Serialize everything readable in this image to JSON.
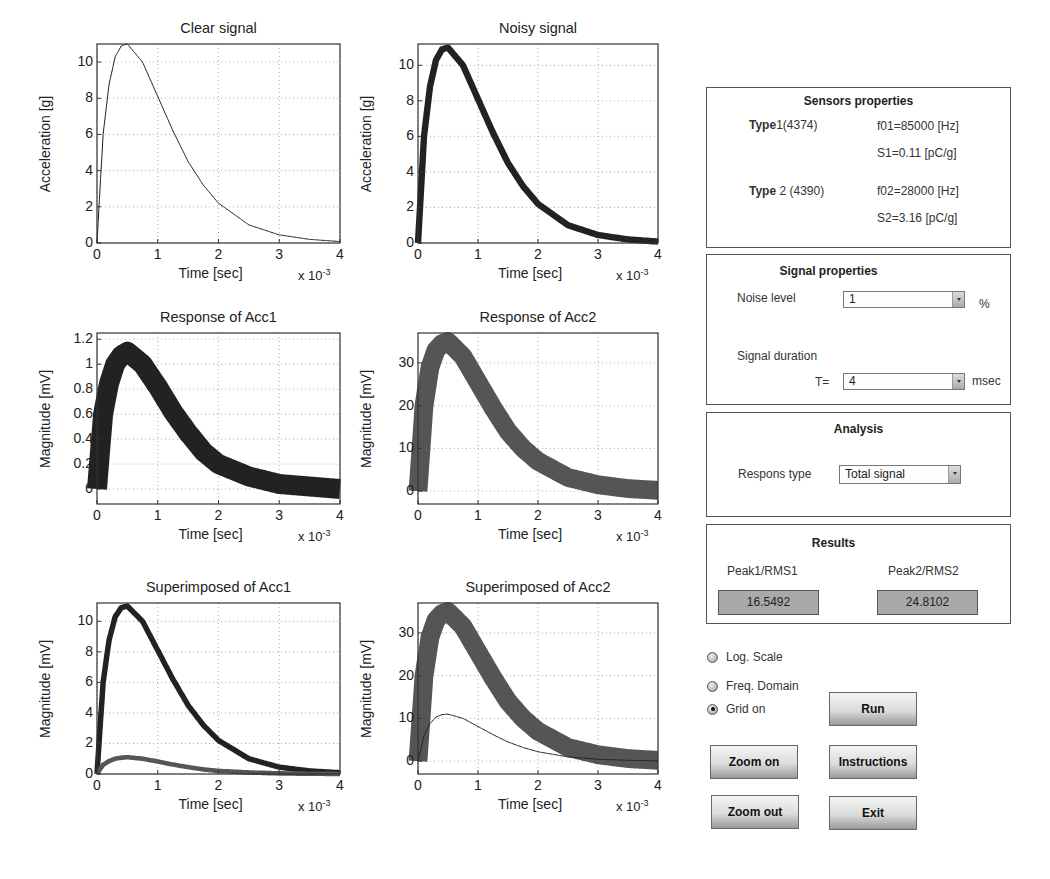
{
  "plots": [
    {
      "id": "clear",
      "title": "Clear signal",
      "ylabel": "Acceleration [g]",
      "xlabel": "Time [sec]",
      "xexp": "x 10",
      "xexp_pow": "-3",
      "yticks": [
        "0",
        "2",
        "4",
        "6",
        "8",
        "10"
      ],
      "xticks": [
        "0",
        "1",
        "2",
        "3",
        "4"
      ]
    },
    {
      "id": "noisy",
      "title": "Noisy signal",
      "ylabel": "Acceleration [g]",
      "xlabel": "Time [sec]",
      "xexp": "x 10",
      "xexp_pow": "-3",
      "yticks": [
        "0",
        "2",
        "4",
        "6",
        "8",
        "10"
      ],
      "xticks": [
        "0",
        "1",
        "2",
        "3",
        "4"
      ]
    },
    {
      "id": "resp1",
      "title": "Response of Acc1",
      "ylabel": "Magnitude [mV]",
      "xlabel": "Time [sec]",
      "xexp": "x 10",
      "xexp_pow": "-3",
      "yticks": [
        "0",
        "0.2",
        "0.4",
        "0.6",
        "0.8",
        "1",
        "1.2"
      ],
      "xticks": [
        "0",
        "1",
        "2",
        "3",
        "4"
      ]
    },
    {
      "id": "resp2",
      "title": "Response of Acc2",
      "ylabel": "Magnitude [mV]",
      "xlabel": "Time [sec]",
      "xexp": "x 10",
      "xexp_pow": "-3",
      "yticks": [
        "0",
        "10",
        "20",
        "30"
      ],
      "xticks": [
        "0",
        "1",
        "2",
        "3",
        "4"
      ]
    },
    {
      "id": "sup1",
      "title": "Superimposed of Acc1",
      "ylabel": "Magnitude [mV]",
      "xlabel": "Time [sec]",
      "xexp": "x 10",
      "xexp_pow": "-3",
      "yticks": [
        "0",
        "2",
        "4",
        "6",
        "8",
        "10"
      ],
      "xticks": [
        "0",
        "1",
        "2",
        "3",
        "4"
      ]
    },
    {
      "id": "sup2",
      "title": "Superimposed of Acc2",
      "ylabel": "Magnitude [mV]",
      "xlabel": "Time [sec]",
      "xexp": "x 10",
      "xexp_pow": "-3",
      "yticks": [
        "0",
        "10",
        "20",
        "30"
      ],
      "xticks": [
        "0",
        "1",
        "2",
        "3",
        "4"
      ]
    }
  ],
  "sensors": {
    "title": "Sensors properties",
    "type1_bold": "Type",
    "type1_rest": "1(4374)",
    "f01": "f01=85000 [Hz]",
    "s1": "S1=0.11 [pC/g]",
    "type2_bold": "Type",
    "type2_rest": " 2 (4390)",
    "f02": "f02=28000 [Hz]",
    "s2": "S2=3.16 [pC/g]"
  },
  "signal": {
    "title": "Signal properties",
    "noise_label": "Noise level",
    "noise_value": "1",
    "noise_unit": "%",
    "duration_label": "Signal duration",
    "t_label": "T=",
    "t_value": "4",
    "t_unit": "msec"
  },
  "analysis": {
    "title": "Analysis",
    "response_label": "Respons type",
    "response_value": "Total signal"
  },
  "results": {
    "title": "Results",
    "label1": "Peak1/RMS1",
    "value1": "16.5492",
    "label2": "Peak2/RMS2",
    "value2": "24.8102"
  },
  "options": [
    {
      "label": "Log. Scale",
      "checked": false
    },
    {
      "label": "Freq. Domain",
      "checked": false
    },
    {
      "label": "Grid on",
      "checked": true
    }
  ],
  "buttons": {
    "run": "Run",
    "zoom_on": "Zoom on",
    "instructions": "Instructions",
    "zoom_out": "Zoom out",
    "exit": "Exit"
  },
  "chart_data": [
    {
      "type": "line",
      "title": "Clear signal",
      "xlabel": "Time [sec] (x 10^-3)",
      "ylabel": "Acceleration [g]",
      "xlim": [
        0,
        4
      ],
      "ylim": [
        0,
        11
      ],
      "grid": true,
      "x": [
        0,
        0.1,
        0.2,
        0.3,
        0.4,
        0.5,
        0.75,
        1.0,
        1.25,
        1.5,
        1.75,
        2.0,
        2.5,
        3.0,
        3.5,
        4.0
      ],
      "series": [
        {
          "name": "clear",
          "values": [
            0,
            6.0,
            8.8,
            10.3,
            10.9,
            11.0,
            10.0,
            8.1,
            6.2,
            4.5,
            3.2,
            2.2,
            1.0,
            0.45,
            0.2,
            0.08
          ]
        }
      ]
    },
    {
      "type": "line",
      "title": "Noisy signal",
      "xlabel": "Time [sec] (x 10^-3)",
      "ylabel": "Acceleration [g]",
      "xlim": [
        0,
        4
      ],
      "ylim": [
        0,
        11.2
      ],
      "grid": true,
      "x": [
        0,
        0.1,
        0.2,
        0.3,
        0.4,
        0.5,
        0.75,
        1.0,
        1.25,
        1.5,
        1.75,
        2.0,
        2.5,
        3.0,
        3.5,
        4.0
      ],
      "series": [
        {
          "name": "noisy",
          "values": [
            0,
            6.0,
            8.8,
            10.3,
            10.9,
            11.0,
            10.0,
            8.1,
            6.2,
            4.5,
            3.2,
            2.2,
            1.0,
            0.45,
            0.2,
            0.08
          ]
        }
      ]
    },
    {
      "type": "line",
      "title": "Response of Acc1",
      "xlabel": "Time [sec] (x 10^-3)",
      "ylabel": "Magnitude [mV]",
      "xlim": [
        0,
        4
      ],
      "ylim": [
        -0.12,
        1.25
      ],
      "grid": true,
      "x": [
        0,
        0.1,
        0.2,
        0.3,
        0.4,
        0.5,
        0.75,
        1.0,
        1.25,
        1.5,
        1.75,
        2.0,
        2.5,
        3.0,
        3.5,
        4.0
      ],
      "series": [
        {
          "name": "Acc1",
          "values": [
            0,
            0.6,
            0.85,
            1.0,
            1.07,
            1.1,
            1.0,
            0.82,
            0.62,
            0.45,
            0.3,
            0.2,
            0.1,
            0.04,
            0.02,
            0.0
          ]
        }
      ]
    },
    {
      "type": "line",
      "title": "Response of Acc2",
      "xlabel": "Time [sec] (x 10^-3)",
      "ylabel": "Magnitude [mV]",
      "xlim": [
        0,
        4
      ],
      "ylim": [
        -3,
        37
      ],
      "grid": true,
      "x": [
        0,
        0.1,
        0.2,
        0.3,
        0.4,
        0.5,
        0.75,
        1.0,
        1.25,
        1.5,
        1.75,
        2.0,
        2.5,
        3.0,
        3.5,
        4.0
      ],
      "series": [
        {
          "name": "Acc2",
          "values": [
            0,
            20,
            29,
            33,
            34.5,
            35,
            31.5,
            25.5,
            19.5,
            14,
            10,
            7,
            3.2,
            1.5,
            0.6,
            0.2
          ]
        }
      ]
    },
    {
      "type": "line",
      "title": "Superimposed of Acc1",
      "xlabel": "Time [sec] (x 10^-3)",
      "ylabel": "Magnitude [mV]",
      "xlim": [
        0,
        4
      ],
      "ylim": [
        0,
        11.2
      ],
      "grid": true,
      "x": [
        0,
        0.1,
        0.2,
        0.3,
        0.4,
        0.5,
        0.75,
        1.0,
        1.25,
        1.5,
        1.75,
        2.0,
        2.5,
        3.0,
        3.5,
        4.0
      ],
      "series": [
        {
          "name": "clear signal",
          "values": [
            0,
            6.0,
            8.8,
            10.3,
            10.9,
            11.0,
            10.0,
            8.1,
            6.2,
            4.5,
            3.2,
            2.2,
            1.0,
            0.45,
            0.2,
            0.08
          ]
        },
        {
          "name": "Acc1 response",
          "values": [
            0,
            0.6,
            0.85,
            1.0,
            1.07,
            1.1,
            1.0,
            0.82,
            0.62,
            0.45,
            0.3,
            0.2,
            0.1,
            0.04,
            0.02,
            0.0
          ]
        }
      ]
    },
    {
      "type": "line",
      "title": "Superimposed of Acc2",
      "xlabel": "Time [sec] (x 10^-3)",
      "ylabel": "Magnitude [mV]",
      "xlim": [
        0,
        4
      ],
      "ylim": [
        -3,
        37
      ],
      "grid": true,
      "x": [
        0,
        0.1,
        0.2,
        0.3,
        0.4,
        0.5,
        0.75,
        1.0,
        1.25,
        1.5,
        1.75,
        2.0,
        2.5,
        3.0,
        3.5,
        4.0
      ],
      "series": [
        {
          "name": "Acc2 response",
          "values": [
            0,
            20,
            29,
            33,
            34.5,
            35,
            31.5,
            25.5,
            19.5,
            14,
            10,
            7,
            3.2,
            1.5,
            0.6,
            0.2
          ]
        },
        {
          "name": "clear signal",
          "values": [
            0,
            6.0,
            8.8,
            10.3,
            10.9,
            11.0,
            10.0,
            8.1,
            6.2,
            4.5,
            3.2,
            2.2,
            1.0,
            0.45,
            0.2,
            0.08
          ]
        }
      ]
    }
  ]
}
